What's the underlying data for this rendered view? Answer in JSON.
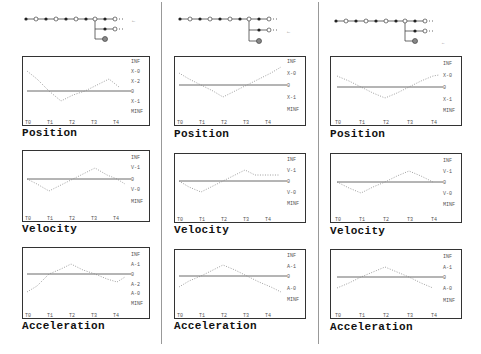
{
  "columns": [
    {
      "id": "col-1",
      "tree": {
        "main_nodes": 10,
        "branch_nodes": 2,
        "has_end_node": true,
        "arrow": "←"
      },
      "charts": [
        {
          "title": "Position",
          "right_labels": [
            "INF",
            "X-0",
            "X-2",
            "0",
            "X-1",
            "MINF"
          ],
          "x_ticks": [
            "T0",
            "T1",
            "T2",
            "T3",
            "T4"
          ]
        },
        {
          "title": "Velocity",
          "right_labels": [
            "INF",
            "V-1",
            "0",
            "V-0",
            "MINF"
          ],
          "x_ticks": [
            "T0",
            "T1",
            "T2",
            "T3",
            "T4"
          ]
        },
        {
          "title": "Acceleration",
          "right_labels": [
            "INF",
            "A-1",
            "0",
            "A-2",
            "A-0",
            "MINF"
          ],
          "x_ticks": [
            "T0",
            "T1",
            "T2",
            "T3",
            "T4"
          ]
        }
      ]
    },
    {
      "id": "col-2",
      "tree": {
        "main_nodes": 10,
        "branch_nodes": 2,
        "has_end_node": true,
        "arrow": "←"
      },
      "charts": [
        {
          "title": "Position",
          "right_labels": [
            "INF",
            "X-0",
            "0",
            "X-1",
            "MINF"
          ],
          "x_ticks": [
            "T0",
            "T1",
            "T2",
            "T3",
            "T4"
          ]
        },
        {
          "title": "Velocity",
          "right_labels": [
            "INF",
            "V-1",
            "0",
            "V-0",
            "MINF"
          ],
          "x_ticks": [
            "T0",
            "T1",
            "T2",
            "T3",
            "T4"
          ]
        },
        {
          "title": "Acceleration",
          "right_labels": [
            "INF",
            "A-1",
            "0",
            "A-0",
            "MINF"
          ],
          "x_ticks": [
            "T0",
            "T1",
            "T2",
            "T3",
            "T4"
          ]
        }
      ]
    },
    {
      "id": "col-3",
      "tree": {
        "main_nodes": 10,
        "branch_nodes": 2,
        "has_end_node": true,
        "arrow": "←"
      },
      "charts": [
        {
          "title": "Position",
          "right_labels": [
            "INF",
            "X-0",
            "0",
            "X-1",
            "MINF"
          ],
          "x_ticks": [
            "T0",
            "T1",
            "T2",
            "T3",
            "T4"
          ]
        },
        {
          "title": "Velocity",
          "right_labels": [
            "INF",
            "V-1",
            "0",
            "V-0",
            "MINF"
          ],
          "x_ticks": [
            "T0",
            "T1",
            "T2",
            "T3",
            "T4"
          ]
        },
        {
          "title": "Acceleration",
          "right_labels": [
            "INF",
            "A-1",
            "0",
            "A-0",
            "MINF"
          ],
          "x_ticks": [
            "T0",
            "T1",
            "T2",
            "T3",
            "T4"
          ]
        }
      ]
    }
  ],
  "colors": {
    "border": "#333333",
    "trace": "#777777",
    "zero_line": "#444444",
    "divider": "#999999"
  }
}
